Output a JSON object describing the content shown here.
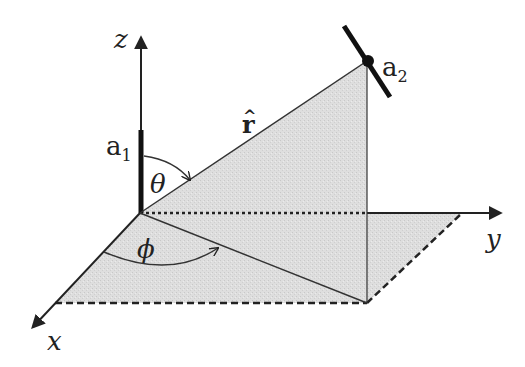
{
  "diagram": {
    "type": "spherical-coordinates",
    "colors": {
      "line": "#222222",
      "shade": "#d9d9d9",
      "background": "#ffffff"
    },
    "axes": {
      "x_label": "x",
      "y_label": "y",
      "z_label": "z"
    },
    "labels": {
      "a1_base": "a",
      "a1_sub": "1",
      "a2_base": "a",
      "a2_sub": "2",
      "r_hat": "r",
      "r_hat_accent": "^",
      "theta": "θ",
      "phi": "ϕ"
    }
  }
}
